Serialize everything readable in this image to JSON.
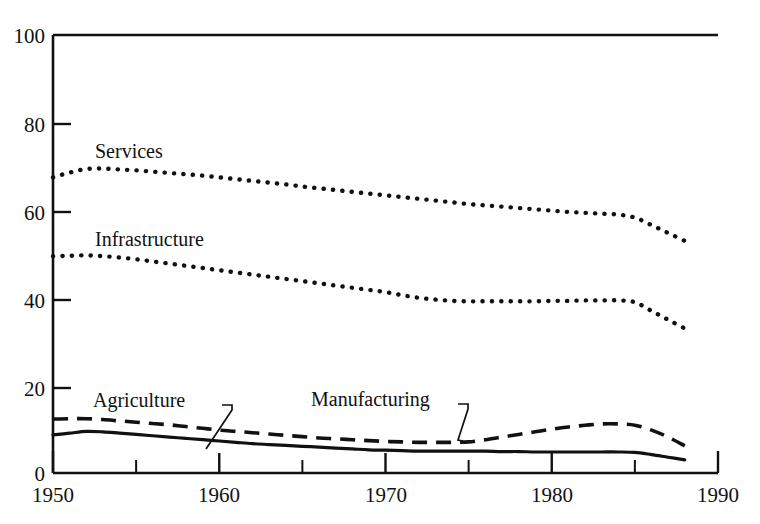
{
  "chart_data": {
    "type": "line",
    "title": "",
    "subtitle": "",
    "xlabel": "",
    "ylabel": "",
    "xlim": [
      1950,
      1990
    ],
    "ylim": [
      0,
      100
    ],
    "grid": false,
    "legend_position": "inline-labels",
    "x_ticks_major": [
      1950,
      1960,
      1970,
      1980,
      1990
    ],
    "x_ticks_minor": [
      1955,
      1965,
      1975,
      1985
    ],
    "x_tick_labels": [
      "1950",
      "1960",
      "1970",
      "1980",
      "1990"
    ],
    "y_ticks": [
      0,
      20,
      40,
      60,
      80,
      100
    ],
    "y_tick_labels": [
      "0",
      "20",
      "40",
      "60",
      "80",
      "100"
    ],
    "x": [
      1950,
      1951,
      1952,
      1953,
      1954,
      1955,
      1956,
      1957,
      1958,
      1959,
      1960,
      1961,
      1962,
      1963,
      1964,
      1965,
      1966,
      1967,
      1968,
      1969,
      1970,
      1971,
      1972,
      1973,
      1974,
      1975,
      1976,
      1977,
      1978,
      1979,
      1980,
      1981,
      1982,
      1983,
      1984,
      1985,
      1986,
      1987,
      1988
    ],
    "series": [
      {
        "name": "Services",
        "style": "dotted",
        "label_x": 1955,
        "label_y": 75,
        "values": [
          67.5,
          68.6,
          69.4,
          69.5,
          69.3,
          69.1,
          68.8,
          68.5,
          68.2,
          67.9,
          67.5,
          67.1,
          66.7,
          66.3,
          65.9,
          65.4,
          65.0,
          64.6,
          64.2,
          63.8,
          63.4,
          63.0,
          62.6,
          62.2,
          61.8,
          61.4,
          61.1,
          60.8,
          60.5,
          60.2,
          59.9,
          59.6,
          59.4,
          59.2,
          59.0,
          58.3,
          56.6,
          54.8,
          53.0
        ]
      },
      {
        "name": "Infrastructure",
        "style": "dotted",
        "label_x": 1955,
        "label_y": 55,
        "values": [
          49.5,
          49.6,
          49.7,
          49.5,
          49.2,
          48.8,
          48.3,
          47.8,
          47.3,
          46.8,
          46.3,
          45.8,
          45.3,
          44.8,
          44.3,
          43.8,
          43.3,
          42.8,
          42.3,
          41.8,
          41.3,
          40.6,
          40.0,
          39.6,
          39.3,
          39.2,
          39.2,
          39.2,
          39.2,
          39.2,
          39.3,
          39.3,
          39.4,
          39.4,
          39.4,
          39.0,
          37.0,
          35.0,
          33.0
        ]
      },
      {
        "name": "Manufacturing",
        "style": "dashed",
        "label_x": 1971,
        "label_y": 14.5,
        "values": [
          12.3,
          12.4,
          12.4,
          12.2,
          11.9,
          11.6,
          11.3,
          11.0,
          10.6,
          10.2,
          9.8,
          9.5,
          9.2,
          8.9,
          8.6,
          8.3,
          8.0,
          7.8,
          7.6,
          7.4,
          7.2,
          7.1,
          7.0,
          7.0,
          7.0,
          7.1,
          7.6,
          8.2,
          8.8,
          9.4,
          10.0,
          10.5,
          10.9,
          11.2,
          11.2,
          10.9,
          9.8,
          8.2,
          6.2
        ]
      },
      {
        "name": "Agriculture",
        "style": "solid",
        "label_x": 1955,
        "label_y": 15.5,
        "values": [
          8.7,
          9.1,
          9.5,
          9.4,
          9.1,
          8.8,
          8.5,
          8.2,
          7.9,
          7.6,
          7.3,
          7.0,
          6.7,
          6.5,
          6.3,
          6.1,
          5.9,
          5.7,
          5.5,
          5.3,
          5.2,
          5.1,
          5.0,
          5.0,
          5.0,
          5.0,
          5.0,
          4.9,
          4.9,
          4.8,
          4.8,
          4.8,
          4.8,
          4.8,
          4.8,
          4.7,
          4.2,
          3.6,
          3.0
        ]
      }
    ],
    "annotations": [
      {
        "text": "Services",
        "target": "Services"
      },
      {
        "text": "Infrastructure",
        "target": "Infrastructure"
      },
      {
        "text": "Agriculture",
        "target": "Agriculture"
      },
      {
        "text": "Manufacturing",
        "target": "Manufacturing"
      }
    ]
  },
  "axis": {
    "y_labels": [
      "100",
      "80",
      "60",
      "40",
      "20",
      "0"
    ],
    "x_labels": [
      "1950",
      "1960",
      "1970",
      "1980",
      "1990"
    ]
  },
  "labels": {
    "services": "Services",
    "infrastructure": "Infrastructure",
    "agriculture": "Agriculture",
    "manufacturing": "Manufacturing"
  },
  "colors": {
    "ink": "#111111",
    "background": "#ffffff"
  }
}
